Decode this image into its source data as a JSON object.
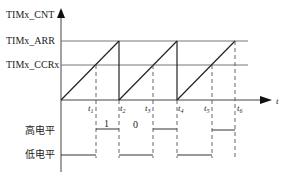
{
  "diagram": {
    "type": "timing-diagram",
    "y_axis_label": "TIMx_CNT",
    "x_axis_label": "t",
    "levels": {
      "arr_label": "TIMx_ARR",
      "ccr_label": "TIMx_CCRx"
    },
    "time_marks": [
      {
        "label": "t",
        "sub": "1"
      },
      {
        "label": "t",
        "sub": "2"
      },
      {
        "label": "t",
        "sub": "3"
      },
      {
        "label": "t",
        "sub": "4"
      },
      {
        "label": "t",
        "sub": "5"
      },
      {
        "label": "t",
        "sub": "6"
      }
    ],
    "output": {
      "high_label": "高电平",
      "low_label": "低电平",
      "bit_labels": [
        "1",
        "0"
      ]
    }
  }
}
